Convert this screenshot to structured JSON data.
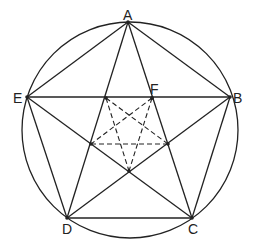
{
  "diagram": {
    "type": "geometry",
    "circle": {
      "cx": 130,
      "cy": 130,
      "r": 108
    },
    "points": {
      "A": {
        "label": "A",
        "x": 128,
        "y": 22,
        "label_x": 123,
        "label_y": 20
      },
      "B": {
        "label": "B",
        "x": 230,
        "y": 97,
        "label_x": 233,
        "label_y": 103
      },
      "C": {
        "label": "C",
        "x": 192,
        "y": 218,
        "label_x": 188,
        "label_y": 234
      },
      "D": {
        "label": "D",
        "x": 67,
        "y": 218,
        "label_x": 62,
        "label_y": 234
      },
      "E": {
        "label": "E",
        "x": 27,
        "y": 97,
        "label_x": 13,
        "label_y": 103
      },
      "F": {
        "label": "F",
        "x": 152,
        "y": 98,
        "label_x": 150,
        "label_y": 94
      }
    },
    "inner_points": {
      "P1": {
        "x": 106,
        "y": 98
      },
      "F": {
        "x": 152,
        "y": 98
      },
      "P3": {
        "x": 168,
        "y": 144
      },
      "P4": {
        "x": 129,
        "y": 171
      },
      "P5": {
        "x": 91,
        "y": 144
      }
    },
    "solid_segments": [
      [
        "A",
        "B"
      ],
      [
        "B",
        "C"
      ],
      [
        "C",
        "D"
      ],
      [
        "D",
        "E"
      ],
      [
        "E",
        "A"
      ],
      [
        "A",
        "C"
      ],
      [
        "A",
        "D"
      ],
      [
        "B",
        "D"
      ],
      [
        "B",
        "E"
      ],
      [
        "C",
        "E"
      ]
    ],
    "dashed_segments": [
      [
        "P1",
        "P3"
      ],
      [
        "P1",
        "P4"
      ],
      [
        "F",
        "P5"
      ],
      [
        "F",
        "P4"
      ],
      [
        "P5",
        "P3"
      ]
    ],
    "colors": {
      "line": "#222222",
      "background": "#ffffff"
    }
  }
}
